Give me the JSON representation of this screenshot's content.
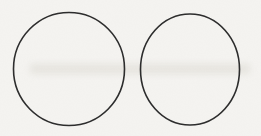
{
  "figure": {
    "background_color": "#f5f4f1",
    "stroke_color": "#2d2d2d",
    "stroke_width": 1.6,
    "smudge_color": "#dcd9d2",
    "canvas": {
      "width": 261,
      "height": 136
    },
    "smudge": {
      "x": 30,
      "y": 64,
      "width": 220,
      "height": 10
    },
    "circles": [
      {
        "name": "left-circle",
        "cx": 69,
        "cy": 69,
        "rx": 55.5,
        "ry": 56.5
      },
      {
        "name": "right-circle",
        "cx": 190,
        "cy": 69.5,
        "rx": 49.5,
        "ry": 55.5
      }
    ]
  }
}
